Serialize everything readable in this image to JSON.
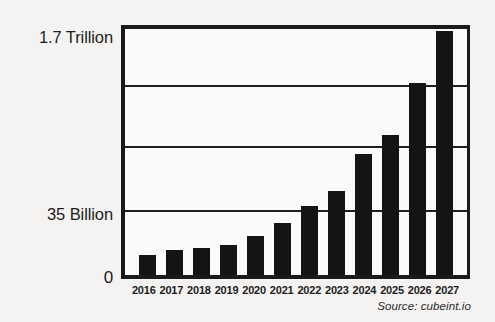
{
  "chart_data": {
    "type": "bar",
    "title": "",
    "xlabel": "",
    "ylabel": "",
    "categories": [
      "2016",
      "2017",
      "2018",
      "2019",
      "2020",
      "2021",
      "2022",
      "2023",
      "2024",
      "2025",
      "2026",
      "2027"
    ],
    "values": [
      8,
      10,
      11,
      12,
      16,
      21,
      28,
      34,
      49,
      57,
      78,
      99
    ],
    "value_unit": "percent of plot height",
    "grid": true,
    "legend": null,
    "axis": {
      "y_tick_labels": [
        "1.7 Trillion",
        "35 Billion",
        "0"
      ],
      "y_top_label": "1.7 Trillion",
      "y_mid_label": "35 Billion",
      "y_zero_label": "0",
      "y_gridline_fractions": [
        1.0,
        0.765,
        0.516,
        0.258,
        0.0
      ],
      "x_tick_labels": [
        "2016",
        "2017",
        "2018",
        "2019",
        "2020",
        "2021",
        "2022",
        "2023",
        "2024",
        "2025",
        "2026",
        "2027"
      ]
    },
    "annotations": {
      "source": "Source: cubeint.io"
    },
    "colors": {
      "background": "#f4f3f1",
      "plot_background": "#fbfaf9",
      "bar": "#141414",
      "axis": "#1a1a1a",
      "grid": "#1f1f1f",
      "text": "#1c1c1c"
    }
  }
}
